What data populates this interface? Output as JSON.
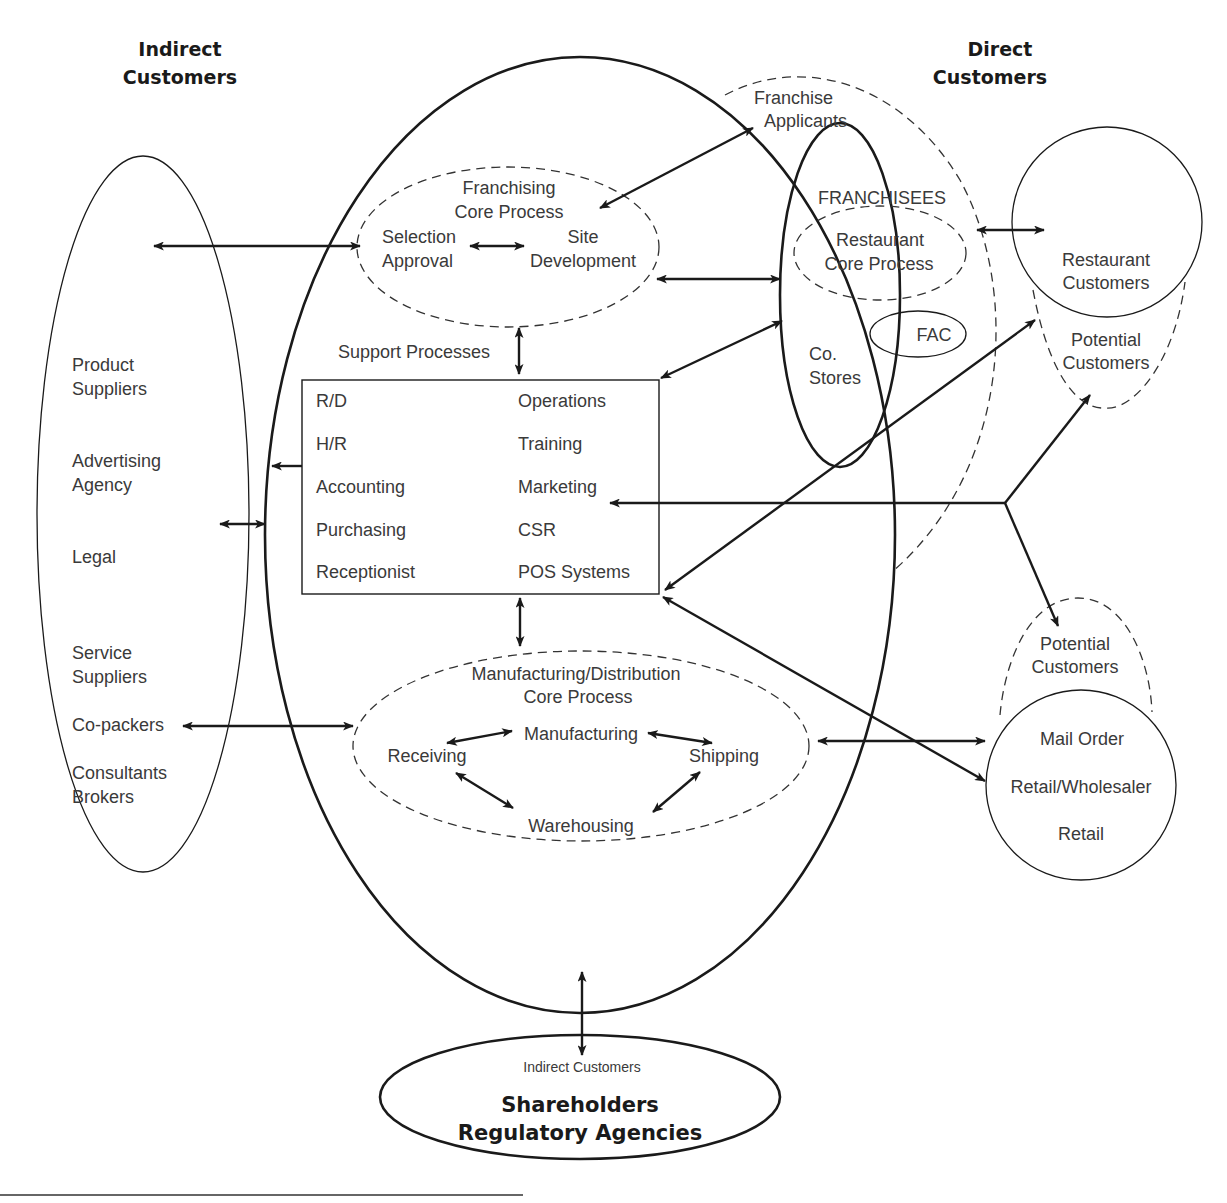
{
  "headers": {
    "indirect_customers": [
      "Indirect",
      "Customers"
    ],
    "direct_customers": [
      "Direct",
      "Customers"
    ]
  },
  "indirect_ellipse": {
    "items": [
      [
        "Product",
        "Suppliers"
      ],
      [
        "Advertising",
        "Agency"
      ],
      [
        "Legal"
      ],
      [
        "Service",
        "Suppliers"
      ],
      [
        "Co-packers"
      ],
      [
        "Consultants",
        "Brokers"
      ]
    ]
  },
  "franchising_core": {
    "title": [
      "Franchising",
      "Core Process"
    ],
    "left": [
      "Selection",
      "Approval"
    ],
    "right": [
      "Site",
      "Development"
    ]
  },
  "support": {
    "title": "Support Processes",
    "left_col": [
      "R/D",
      "H/R",
      "Accounting",
      "Purchasing",
      "Receptionist"
    ],
    "right_col": [
      "Operations",
      "Training",
      "Marketing",
      "CSR",
      "POS Systems"
    ]
  },
  "manufacturing_core": {
    "title": [
      "Manufacturing/Distribution",
      "Core Process"
    ],
    "nodes": {
      "receiving": "Receiving",
      "manufacturing": "Manufacturing",
      "shipping": "Shipping",
      "warehousing": "Warehousing"
    }
  },
  "franchise_applicants": [
    "Franchise",
    "Applicants"
  ],
  "franchisees": {
    "title": "FRANCHISEES",
    "restaurant_core": [
      "Restaurant",
      "Core Process"
    ],
    "fac": "FAC",
    "co_stores": [
      "Co.",
      "Stores"
    ]
  },
  "restaurant_customers": {
    "label": [
      "Restaurant",
      "Customers"
    ],
    "potential": [
      "Potential",
      "Customers"
    ]
  },
  "retail_customers": {
    "potential": [
      "Potential",
      "Customers"
    ],
    "items": [
      "Mail Order",
      "Retail/Wholesaler",
      "Retail"
    ]
  },
  "shareholders": {
    "sub": "Indirect Customers",
    "title": [
      "Shareholders",
      "Regulatory Agencies"
    ]
  }
}
